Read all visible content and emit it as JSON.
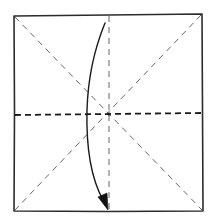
{
  "diagram": {
    "type": "origami-fold-step",
    "paper": "square",
    "creases": [
      {
        "name": "diagonal-top-left-to-bottom-right",
        "style": "valley-crease"
      },
      {
        "name": "diagonal-top-right-to-bottom-left",
        "style": "valley-crease"
      },
      {
        "name": "vertical-center",
        "style": "valley-crease"
      }
    ],
    "fold_line": {
      "name": "horizontal-center",
      "style": "valley-fold"
    },
    "arrow": {
      "direction": "down",
      "meaning": "fold top half down to bottom edge",
      "head": "filled"
    },
    "colors": {
      "line": "#2b2b2b",
      "crease": "#555555",
      "background": "#ffffff"
    }
  }
}
